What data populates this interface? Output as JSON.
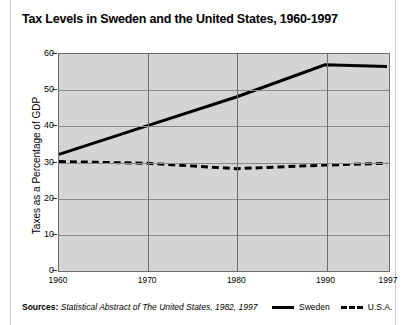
{
  "figure": {
    "title": "Tax Levels in Sweden and the United States, 1960-1997",
    "sources_label": "Sources:",
    "sources_text": "Statistical Abstract of The United States, 1982, 1997"
  },
  "chart_data": {
    "type": "line",
    "title": "Tax Levels in Sweden and the United States, 1960-1997",
    "xlabel": "",
    "ylabel": "Taxes as a Percentage of GDP",
    "x": [
      1960,
      1970,
      1980,
      1990,
      1997
    ],
    "xtick_labels": [
      "1960",
      "1970",
      "1980",
      "1990",
      "1997"
    ],
    "ytick_labels": [
      "0",
      "10",
      "20",
      "30",
      "40",
      "50",
      "60"
    ],
    "ytick_values": [
      0,
      10,
      20,
      30,
      40,
      50,
      60
    ],
    "xlim": [
      1960,
      1997
    ],
    "ylim": [
      0,
      60
    ],
    "grid": true,
    "legend_position": "bottom-right",
    "series": [
      {
        "name": "Sweden",
        "style": "solid",
        "color": "#000000",
        "values": [
          32,
          40,
          48,
          57,
          56.5
        ]
      },
      {
        "name": "U.S.A.",
        "style": "dashed",
        "color": "#000000",
        "values": [
          30,
          29.5,
          28,
          29,
          29.5
        ]
      }
    ]
  },
  "legend": {
    "items": [
      {
        "label": "Sweden",
        "style": "solid"
      },
      {
        "label": "U.S.A.",
        "style": "dashed"
      }
    ]
  }
}
